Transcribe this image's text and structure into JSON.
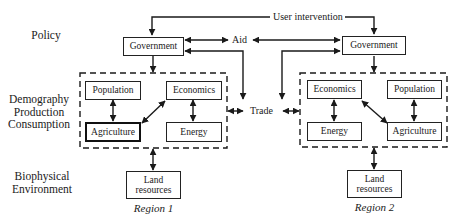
{
  "layers": {
    "policy": "Policy",
    "demography": [
      "Demography",
      "Production",
      "Consumption"
    ],
    "biophysical": [
      "Biophysical",
      "Environment"
    ]
  },
  "connectors": {
    "user_intervention": "User intervention",
    "aid": "Aid",
    "trade": "Trade"
  },
  "region1": {
    "label": "Region 1",
    "government": "Government",
    "population": "Population",
    "economics": "Economics",
    "agriculture": "Agriculture",
    "energy": "Energy",
    "land": [
      "Land",
      "resources"
    ]
  },
  "region2": {
    "label": "Region 2",
    "government": "Government",
    "population": "Population",
    "economics": "Economics",
    "agriculture": "Agriculture",
    "energy": "Energy",
    "land": [
      "Land",
      "resources"
    ]
  },
  "colors": {
    "line": "#1a1a1a",
    "background": "#ffffff"
  }
}
